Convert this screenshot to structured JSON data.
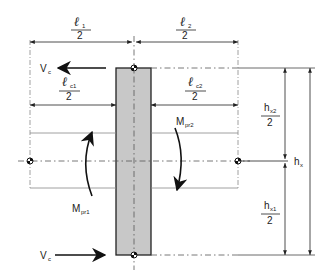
{
  "diagram": {
    "type": "beam-column joint free-body diagram",
    "colors": {
      "column_fill": "#c8c8c8",
      "line": "#222222",
      "dashed": "#888888"
    },
    "top_dims": {
      "left": {
        "numerator": "ℓ",
        "sub": "1",
        "denominator": "2"
      },
      "right": {
        "numerator": "ℓ",
        "sub": "2",
        "denominator": "2"
      }
    },
    "clear_span_dims": {
      "left": {
        "numerator": "ℓ",
        "sub": "c1",
        "denominator": "2"
      },
      "right": {
        "numerator": "ℓ",
        "sub": "c2",
        "denominator": "2"
      }
    },
    "shear_top": {
      "label": "V",
      "sub": "c",
      "direction": "left"
    },
    "shear_bottom": {
      "label": "V",
      "sub": "c",
      "direction": "right"
    },
    "moments": {
      "left": {
        "label": "M",
        "sub": "pr1",
        "direction": "up"
      },
      "right": {
        "label": "M",
        "sub": "pr2",
        "direction": "down"
      }
    },
    "right_dims": {
      "upper": {
        "numerator": "h",
        "sub": "x2",
        "denominator": "2"
      },
      "lower": {
        "numerator": "h",
        "sub": "x1",
        "denominator": "2"
      },
      "total": {
        "label": "h",
        "sub": "x"
      }
    }
  }
}
